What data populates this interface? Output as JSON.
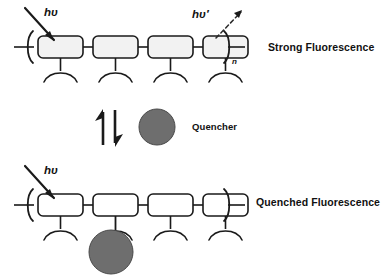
{
  "diagram": {
    "colors": {
      "stroke": "#1a1a1a",
      "repeat_unit_fill_top": "#f2f2f2",
      "repeat_unit_fill_bottom": "#ffffff",
      "quencher_fill": "#6e6e6e",
      "quencher_stroke": "#4a4a4a",
      "background": "#ffffff"
    },
    "top_panel": {
      "name": "strong-fluorescence-panel",
      "state_label": "Strong Fluorescence",
      "excitation_label": "hυ",
      "emission_label": "hυ′",
      "repeat_subscript": "n",
      "repeat_unit_count": 4,
      "excitation_arrow": "solid-arrow-down-right",
      "emission_arrow": "dashed-arrow-up-right"
    },
    "middle_panel": {
      "name": "equilibrium-panel",
      "equilibrium_up_arrow": "arrow-up",
      "equilibrium_down_arrow": "arrow-down",
      "quencher_label": "Quencher",
      "quencher_shape": "filled-circle"
    },
    "bottom_panel": {
      "name": "quenched-fluorescence-panel",
      "state_label": "Quenched Fluorescence",
      "excitation_label": "hυ",
      "repeat_unit_count": 4,
      "excitation_arrow": "solid-arrow-down-right",
      "bound_quencher_unit_index": 2,
      "emission_label": ""
    }
  }
}
